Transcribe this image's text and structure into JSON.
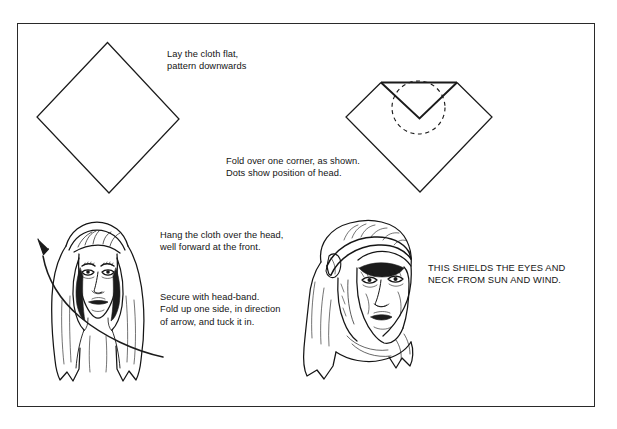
{
  "figure": {
    "border_color": "#2a2a2a",
    "ink_color": "#111111",
    "background_color": "#ffffff"
  },
  "captions": {
    "step1": "Lay the cloth flat,\npattern downwards",
    "step2": "Fold over one corner, as shown.\nDots show position of head.",
    "step3": "Hang the cloth over the head,\nwell forward at the front.",
    "step4": "Secure with head-band.\nFold up one side, in direction\nof arrow, and tuck it in.",
    "step5": "THIS SHIELDS THE EYES AND\nNECK FROM SUN AND WIND."
  },
  "panels": [
    {
      "id": "panel-flat-cloth",
      "label": "Flat diamond cloth"
    },
    {
      "id": "panel-folded-cloth",
      "label": "Folded corner with dotted head circle"
    },
    {
      "id": "panel-cloth-on-head",
      "label": "Cloth hanging over head with fold arrow"
    },
    {
      "id": "panel-secured-headband",
      "label": "Head cloth secured with head-band"
    }
  ]
}
